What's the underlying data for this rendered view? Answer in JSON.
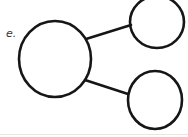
{
  "diagram": {
    "type": "number-bond",
    "label": "e.",
    "nodes": [
      {
        "id": "whole",
        "role": "whole",
        "value": ""
      },
      {
        "id": "part-top",
        "role": "part",
        "value": ""
      },
      {
        "id": "part-bottom",
        "role": "part",
        "value": ""
      }
    ],
    "edges": [
      {
        "from": "whole",
        "to": "part-top"
      },
      {
        "from": "whole",
        "to": "part-bottom"
      }
    ],
    "colors": {
      "stroke": "#161616",
      "label": "#333333",
      "background": "#ffffff"
    }
  }
}
